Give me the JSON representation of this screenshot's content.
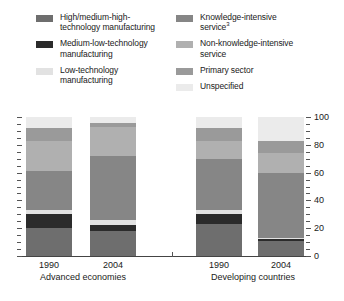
{
  "legend": {
    "columns": [
      {
        "items": [
          {
            "label": "High/medium-high-\ntechnology manufacturing",
            "color": "#6e6e6e",
            "key": "high-medium-high-technology-manufacturing"
          },
          {
            "label": "Medium-low-technology\nmanufacturing",
            "color": "#2b2b2b",
            "key": "medium-low-technology-manufacturing"
          },
          {
            "label": "Low-technology\nmanufacturing",
            "color": "#e2e2e2",
            "key": "low-technology-manufacturing"
          }
        ]
      },
      {
        "items": [
          {
            "label": "Knowledge-intensive\nservice",
            "superscript": "3",
            "color": "#868686",
            "key": "knowledge-intensive-service"
          },
          {
            "label": "Non-knowledge-intensive\nservice",
            "color": "#b0b0b0",
            "key": "non-knowledge-intensive-service"
          },
          {
            "label": "Primary sector",
            "color": "#9a9a9a",
            "key": "primary-sector"
          },
          {
            "label": "Unspecified",
            "color": "#ebebeb",
            "key": "unspecified"
          }
        ]
      }
    ]
  },
  "axis": {
    "y_labels": [
      "100",
      "80",
      "60",
      "40",
      "20",
      "0"
    ],
    "y_values": [
      100,
      80,
      60,
      40,
      20,
      0
    ],
    "y_min": 0,
    "y_max": 100,
    "minor_step": 10
  },
  "groups": [
    {
      "name": "Advanced economies",
      "years": [
        "1990",
        "2004"
      ]
    },
    {
      "name": "Developing countries",
      "years": [
        "1990",
        "2004"
      ]
    }
  ],
  "chart_data": {
    "type": "bar",
    "stacked": true,
    "title": "",
    "xlabel": "",
    "ylabel": "",
    "ylim": [
      0,
      100
    ],
    "grid": false,
    "legend_position": "top",
    "categories": [
      "Advanced economies 1990",
      "Advanced economies 2004",
      "Developing countries 1990",
      "Developing countries 2004"
    ],
    "group_labels": [
      "Advanced economies",
      "Developing countries"
    ],
    "tick_labels": [
      "1990",
      "2004",
      "1990",
      "2004"
    ],
    "series": [
      {
        "name": "High/medium-high-technology manufacturing",
        "color": "#6e6e6e",
        "values": [
          20,
          18,
          23,
          11
        ]
      },
      {
        "name": "Medium-low-technology manufacturing",
        "color": "#2b2b2b",
        "values": [
          10,
          4,
          7,
          1
        ]
      },
      {
        "name": "Low-technology manufacturing",
        "color": "#e2e2e2",
        "values": [
          3,
          4,
          3,
          1
        ]
      },
      {
        "name": "Knowledge-intensive service",
        "color": "#868686",
        "values": [
          28,
          46,
          37,
          47
        ]
      },
      {
        "name": "Non-knowledge-intensive service",
        "color": "#b0b0b0",
        "values": [
          22,
          21,
          13,
          14
        ]
      },
      {
        "name": "Primary sector",
        "color": "#9a9a9a",
        "values": [
          9,
          3,
          9,
          9
        ]
      },
      {
        "name": "Unspecified",
        "color": "#ebebeb",
        "values": [
          8,
          4,
          8,
          17
        ]
      }
    ]
  }
}
